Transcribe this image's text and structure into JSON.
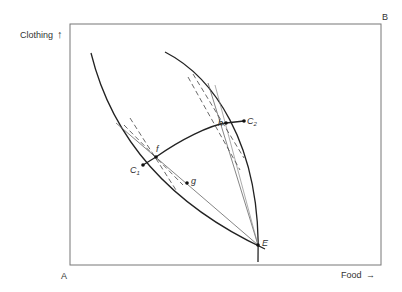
{
  "diagram": {
    "type": "edgeworth-box",
    "axes": {
      "y_label": "Clothing",
      "x_label": "Food",
      "y_arrow": "↑",
      "x_arrow": "→"
    },
    "corners": {
      "origin_A": "A",
      "origin_B": "B"
    },
    "points": {
      "C1": {
        "label": "C",
        "sub": "1"
      },
      "C2": {
        "label": "C",
        "sub": "2"
      },
      "f": {
        "label": "f"
      },
      "g": {
        "label": "g"
      },
      "h": {
        "label": "h"
      },
      "E": {
        "label": "E"
      }
    }
  }
}
